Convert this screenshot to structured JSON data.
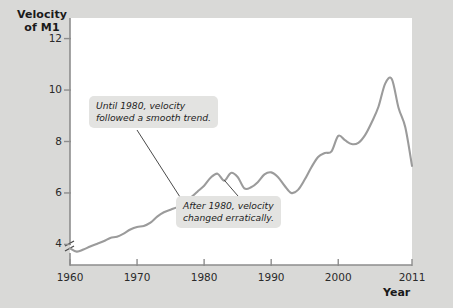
{
  "chart_data": {
    "type": "line",
    "title": "",
    "ylabel": "Velocity of M1",
    "xlabel": "Year",
    "xlim": [
      1960,
      2011
    ],
    "ylim": [
      3.2,
      12.8
    ],
    "yticks": [
      4,
      6,
      8,
      10,
      12
    ],
    "xticks": [
      1960,
      1970,
      1980,
      1990,
      2000,
      2011
    ],
    "ytick_labels": [
      "4",
      "6",
      "8",
      "10",
      "12"
    ],
    "xtick_labels": [
      "1960",
      "1970",
      "1980",
      "1990",
      "2000",
      "2011"
    ],
    "grid": false,
    "legend": null,
    "axis_break": true,
    "line_color": "#9b9b9b",
    "series": [
      {
        "name": "Velocity of M1",
        "x": [
          1960,
          1961,
          1962,
          1963,
          1964,
          1965,
          1966,
          1967,
          1968,
          1969,
          1970,
          1971,
          1972,
          1973,
          1974,
          1975,
          1976,
          1977,
          1978,
          1979,
          1980,
          1981,
          1982,
          1983,
          1984,
          1985,
          1986,
          1987,
          1988,
          1989,
          1990,
          1991,
          1992,
          1993,
          1994,
          1995,
          1996,
          1997,
          1998,
          1999,
          2000,
          2001,
          2002,
          2003,
          2004,
          2005,
          2006,
          2007,
          2008,
          2009,
          2010,
          2011
        ],
        "values": [
          3.85,
          3.72,
          3.8,
          3.92,
          4.02,
          4.12,
          4.25,
          4.3,
          4.42,
          4.58,
          4.68,
          4.72,
          4.85,
          5.08,
          5.25,
          5.35,
          5.45,
          5.6,
          5.82,
          6.05,
          6.28,
          6.6,
          6.75,
          6.48,
          6.78,
          6.62,
          6.18,
          6.22,
          6.42,
          6.72,
          6.8,
          6.62,
          6.28,
          6.0,
          6.12,
          6.52,
          7.0,
          7.4,
          7.55,
          7.62,
          8.22,
          8.05,
          7.9,
          7.95,
          8.25,
          8.75,
          9.35,
          10.25,
          10.42,
          9.3,
          8.55,
          7.05
        ]
      }
    ],
    "annotations": [
      {
        "id": "callout-1",
        "text_line1": "Until 1980, velocity",
        "text_line2": "followed a smooth trend.",
        "points_to_x": 1977,
        "points_to_y": 5.6
      },
      {
        "id": "callout-2",
        "text_line1": "After 1980, velocity",
        "text_line2": "changed erratically.",
        "points_to_x": 1983,
        "points_to_y": 6.5
      }
    ]
  },
  "axis": {
    "y_title_line1": "Velocity",
    "y_title_line2": "of M1",
    "x_title": "Year"
  }
}
